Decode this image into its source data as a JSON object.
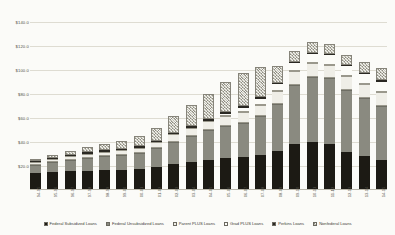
{
  "chart_data": {
    "type": "bar",
    "stacked": true,
    "title": "",
    "xlabel": "",
    "ylabel": "",
    "ylim": [
      0,
      150
    ],
    "grid": true,
    "legend_position": "bottom",
    "ytick_labels": [
      "$140.0",
      "$120.0",
      "$100.0",
      "$80.0",
      "$60.0",
      "$40.0",
      "$20.0"
    ],
    "ytick_values": [
      140,
      120,
      100,
      80,
      60,
      40,
      20
    ],
    "categories": [
      "94-95",
      "95-96",
      "96-97",
      "97-98",
      "98-99",
      "99-00",
      "00-01",
      "01-02",
      "02-03",
      "03-04",
      "04-05",
      "05-06",
      "06-07",
      "07-08",
      "08-09",
      "09-10",
      "10-11",
      "11-12",
      "12-13",
      "13-14",
      "14-15"
    ],
    "series": [
      {
        "name": "Federal Subsidized Loans",
        "color": "#1c1a14",
        "values": [
          14.2,
          15.0,
          15.6,
          16.2,
          16.6,
          17.0,
          17.6,
          19.2,
          21.6,
          23.6,
          25.4,
          26.8,
          27.4,
          29.0,
          32.4,
          38.0,
          39.6,
          38.0,
          32.0,
          28.6,
          25.2
        ]
      },
      {
        "name": "Federal Unsubsidized Loans",
        "color": "#8a8a80",
        "values": [
          6.6,
          8.2,
          9.6,
          10.8,
          11.6,
          12.4,
          13.4,
          15.6,
          18.8,
          21.6,
          24.4,
          26.6,
          28.6,
          32.4,
          39.6,
          49.6,
          54.6,
          55.0,
          51.6,
          48.2,
          45.0
        ]
      },
      {
        "name": "Parent PLUS Loans",
        "color": "#efeee7",
        "values": [
          2.2,
          2.6,
          3.0,
          3.4,
          3.6,
          4.0,
          4.4,
          5.0,
          6.0,
          6.8,
          7.6,
          8.4,
          9.0,
          9.8,
          10.4,
          11.2,
          11.6,
          11.6,
          11.4,
          11.6,
          11.8
        ]
      },
      {
        "name": "Grad PLUS Loans",
        "color": "#fcfcf8",
        "values": [
          0,
          0,
          0,
          0,
          0,
          0,
          0,
          0,
          0,
          0,
          0,
          1.6,
          3.4,
          4.6,
          5.6,
          6.8,
          7.4,
          7.8,
          8.0,
          8.2,
          8.4
        ]
      },
      {
        "name": "Perkins Loans",
        "color": "#2a2822",
        "values": [
          0.9,
          1.0,
          1.1,
          1.2,
          1.2,
          1.2,
          1.3,
          1.3,
          1.4,
          1.4,
          1.4,
          1.4,
          1.4,
          1.4,
          1.2,
          1.0,
          1.0,
          1.0,
          1.0,
          1.0,
          1.0
        ]
      },
      {
        "name": "Nonfederal Loans",
        "color": "#c3c2b6",
        "values": [
          1.6,
          2.2,
          3.0,
          4.0,
          5.2,
          6.6,
          8.4,
          11.0,
          14.0,
          17.6,
          21.6,
          25.4,
          27.6,
          25.0,
          14.0,
          9.6,
          8.8,
          8.4,
          8.6,
          9.2,
          10.0
        ]
      }
    ]
  }
}
